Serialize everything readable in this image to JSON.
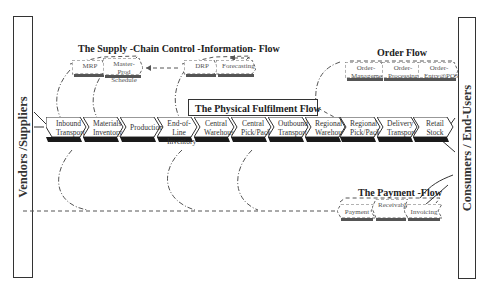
{
  "left_entity": {
    "label": "Vendors /Suppliers"
  },
  "right_entity": {
    "label": "Consumers / End-Users"
  },
  "information_flow": {
    "title": "The Supply -Chain Control -Information- Flow",
    "steps": [
      {
        "label": "MRP"
      },
      {
        "label": "Master-Prod Schedule"
      },
      {
        "label": "DRP"
      },
      {
        "label": "Forecasting"
      }
    ]
  },
  "order_flow": {
    "title": "Order Flow",
    "steps": [
      {
        "label": "Order- Management"
      },
      {
        "label": "Order- Processing"
      },
      {
        "label": "Order- Entry@POS"
      }
    ]
  },
  "physical_flow": {
    "title": "The Physical Fulfilment Flow",
    "steps": [
      {
        "label": "Inbound Transport"
      },
      {
        "label": "Materials Inventory"
      },
      {
        "label": "Production"
      },
      {
        "label": "End-of-Line Inventory"
      },
      {
        "label": "Central Warehouse"
      },
      {
        "label": "Central Pick/Pack"
      },
      {
        "label": "Outbound Transport"
      },
      {
        "label": "Regional Warehouse"
      },
      {
        "label": "Regional Pick/Pack"
      },
      {
        "label": "Delivery Transport"
      },
      {
        "label": "Retail Stock"
      }
    ]
  },
  "payment_flow": {
    "title": "The Payment -Flow",
    "steps": [
      {
        "label": "Payment"
      },
      {
        "label": "Receivables"
      },
      {
        "label": "Invoicing"
      }
    ]
  },
  "colors": {
    "outline": "#333333",
    "chevron_shadow": "#1a1a1a",
    "dashed": "#555555",
    "background": "#ffffff"
  }
}
